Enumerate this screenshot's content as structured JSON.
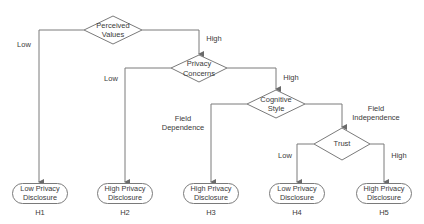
{
  "diagram": {
    "type": "decision-tree",
    "colors": {
      "stroke": "#7a7a7a",
      "text": "#3a3a3a",
      "background": "#ffffff"
    },
    "decisions": [
      {
        "id": "perceived-values",
        "line1": "Perceived",
        "line2": "Values"
      },
      {
        "id": "privacy-concerns",
        "line1": "Privacy",
        "line2": "Concerns"
      },
      {
        "id": "cognitive-style",
        "line1": "Cognitive",
        "line2": "Style"
      },
      {
        "id": "trust",
        "line1": "Trust",
        "line2": ""
      }
    ],
    "edge_labels": {
      "pv_low": "Low",
      "pv_high": "High",
      "pc_low": "Low",
      "pc_high": "High",
      "cs_left_1": "Field",
      "cs_left_2": "Dependence",
      "cs_right_1": "Field",
      "cs_right_2": "Independence",
      "trust_low": "Low",
      "trust_high": "High"
    },
    "outcomes": [
      {
        "id": "H1",
        "line1": "Low Privacy",
        "line2": "Disclosure",
        "label": "H1"
      },
      {
        "id": "H2",
        "line1": "High Privacy",
        "line2": "Disclosure",
        "label": "H2"
      },
      {
        "id": "H3",
        "line1": "High Privacy",
        "line2": "Disclosure",
        "label": "H3"
      },
      {
        "id": "H4",
        "line1": "Low Privacy",
        "line2": "Disclosure",
        "label": "H4"
      },
      {
        "id": "H5",
        "line1": "High Privacy",
        "line2": "Disclosure",
        "label": "H5"
      }
    ]
  }
}
